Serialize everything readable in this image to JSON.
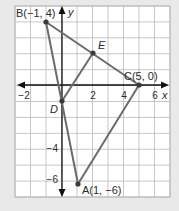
{
  "figure": {
    "type": "coordinate-plane-geometry",
    "grid": {
      "x_min": -3,
      "x_max": 7,
      "y_min": -7,
      "y_max": 5,
      "step": 1
    },
    "axes": {
      "x_label": "x",
      "y_label": "y",
      "x_ticks": [
        {
          "value": -2,
          "label": "−2"
        },
        {
          "value": 2,
          "label": "2"
        },
        {
          "value": 4,
          "label": "4"
        },
        {
          "value": 6,
          "label": "6"
        }
      ],
      "y_ticks": [
        {
          "value": -4,
          "label": "−4"
        },
        {
          "value": -6,
          "label": "−6"
        }
      ]
    },
    "points": {
      "A": {
        "name": "A",
        "label": "A(1, −6)",
        "x": 1,
        "y": -6
      },
      "B": {
        "name": "B",
        "label": "B(−1, 4)",
        "x": -1,
        "y": 4
      },
      "C": {
        "name": "C",
        "label": "C(5, 0)",
        "x": 5,
        "y": 0
      },
      "D": {
        "name": "D",
        "label": "D",
        "x": 0,
        "y": -1
      },
      "E": {
        "name": "E",
        "label": "E",
        "x": 2,
        "y": 2.5
      }
    },
    "segments": [
      {
        "from": "B",
        "to": "C"
      },
      {
        "from": "B",
        "to": "A"
      },
      {
        "from": "A",
        "to": "C"
      },
      {
        "from": "D",
        "to": "E"
      }
    ],
    "colors": {
      "background": "#e9e9e9",
      "grid_fill": "#ffffff",
      "grid_line": "#b9b9b9",
      "axis": "#111111",
      "segment": "#6b6b6b",
      "point": "#3a3a3a",
      "text": "#2a2a2a"
    }
  }
}
